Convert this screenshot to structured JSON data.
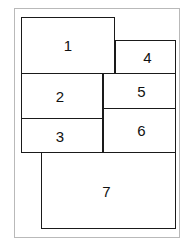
{
  "figure": {
    "type": "block-layout-diagram",
    "background_color": "#ffffff",
    "frame_color": "#b9b9b9",
    "block_border_color": "#1a1a1a",
    "label_color": "#111111",
    "blocks": [
      {
        "id": "1",
        "label": "1"
      },
      {
        "id": "2",
        "label": "2"
      },
      {
        "id": "3",
        "label": "3"
      },
      {
        "id": "4",
        "label": "4"
      },
      {
        "id": "5",
        "label": "5"
      },
      {
        "id": "6",
        "label": "6"
      },
      {
        "id": "7",
        "label": "7"
      }
    ]
  }
}
